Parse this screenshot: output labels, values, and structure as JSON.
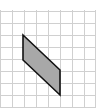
{
  "diagram": {
    "type": "grid-with-parallelogram",
    "grid": {
      "cell_size": 11.8,
      "line_color": "#d0d0d0",
      "vertical_lines_x": [
        0,
        12,
        24,
        36,
        48,
        60,
        72,
        84,
        95
      ],
      "horizontal_lines_y": [
        11,
        23,
        35,
        47,
        59,
        71,
        83,
        95,
        107
      ]
    },
    "shape": {
      "kind": "parallelogram",
      "fill": "#a8a8a8",
      "stroke": "#111111",
      "points": [
        [
          23,
          35
        ],
        [
          60,
          70
        ],
        [
          60,
          95
        ],
        [
          23,
          60
        ]
      ]
    }
  }
}
